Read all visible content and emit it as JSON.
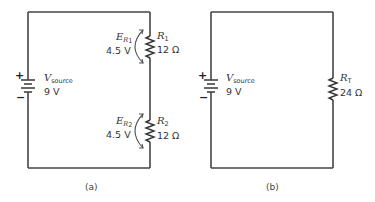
{
  "figure": {
    "panels": [
      {
        "caption": "(a)",
        "source": {
          "label_main": "V",
          "label_sub": "source",
          "value": "9 V",
          "plus": "+",
          "minus": "−"
        },
        "resistors": [
          {
            "label_main": "R",
            "label_sub": "1",
            "value": "12 Ω",
            "drop_label_main": "E",
            "drop_label_sub_main": "R",
            "drop_label_sub_sub": "1",
            "drop_value": "4.5 V"
          },
          {
            "label_main": "R",
            "label_sub": "2",
            "value": "12 Ω",
            "drop_label_main": "E",
            "drop_label_sub_main": "R",
            "drop_label_sub_sub": "2",
            "drop_value": "4.5 V"
          }
        ]
      },
      {
        "caption": "(b)",
        "source": {
          "label_main": "V",
          "label_sub": "source",
          "value": "9 V",
          "plus": "+",
          "minus": "−"
        },
        "resistors": [
          {
            "label_main": "R",
            "label_sub": "T",
            "value": "24 Ω"
          }
        ]
      }
    ]
  }
}
